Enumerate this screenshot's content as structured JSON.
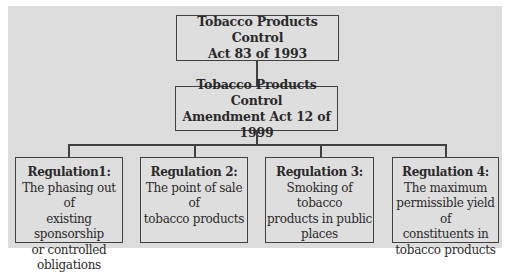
{
  "diagram": {
    "type": "hierarchy",
    "root": {
      "line1": "Tobacco Products Control",
      "line2": "Act 83 of 1993"
    },
    "amendment": {
      "line1": "Tobacco Products Control",
      "line2": "Amendment Act 12 of 1999"
    },
    "regulations": [
      {
        "title": "Regulation1:",
        "lines": [
          "The phasing out of",
          "existing sponsorship",
          "or controlled",
          "obligations"
        ]
      },
      {
        "title": "Regulation 2:",
        "lines": [
          "The point of sale of",
          "tobacco products"
        ]
      },
      {
        "title": "Regulation 3:",
        "lines": [
          "Smoking of tobacco",
          "products in public",
          "places"
        ]
      },
      {
        "title": "Regulation 4:",
        "lines": [
          "The maximum",
          "permissible yield of",
          "constituents in",
          "tobacco products"
        ]
      }
    ],
    "colors": {
      "background": "#dcdcdc",
      "box_fill": "#dedede",
      "border": "#404040",
      "text": "#2a2a2a"
    }
  }
}
